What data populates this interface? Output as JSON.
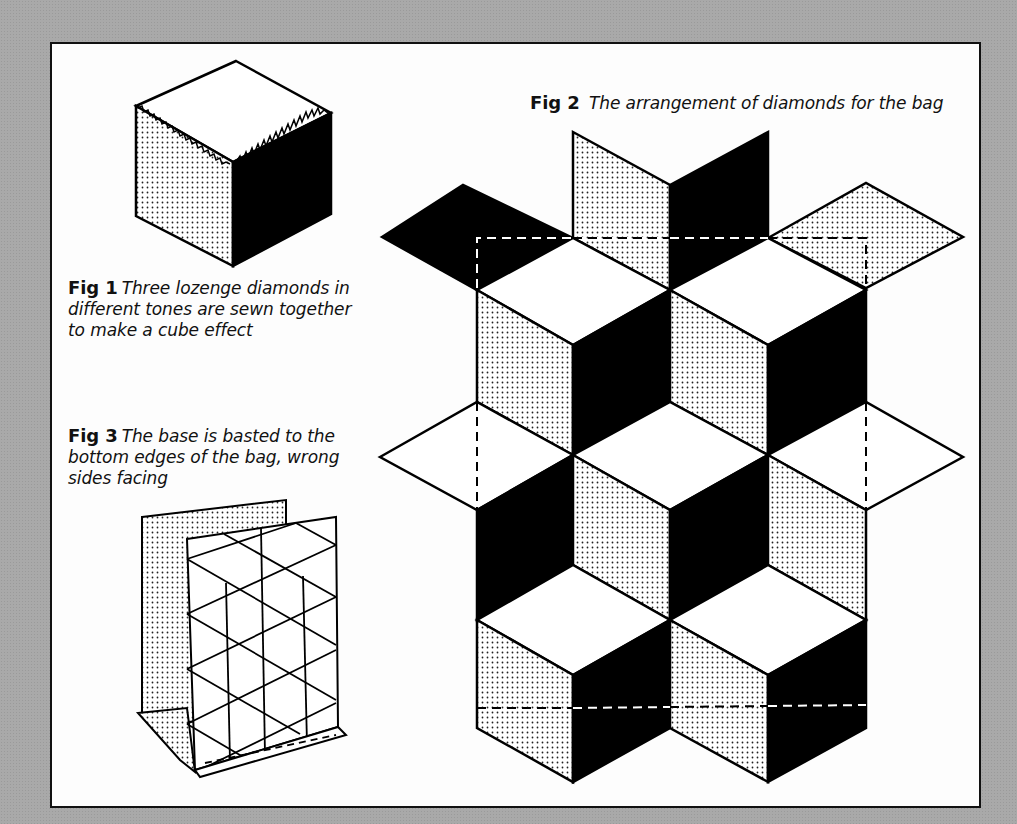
{
  "figures": [
    {
      "id": "fig1",
      "label": "Fig 1",
      "caption_lines": [
        "Three lozenge diamonds in",
        "different tones are sewn together",
        "to make a cube effect"
      ]
    },
    {
      "id": "fig2",
      "label": "Fig 2",
      "caption": "The arrangement of diamonds for the bag"
    },
    {
      "id": "fig3",
      "label": "Fig 3",
      "caption_lines": [
        "The base is basted to the",
        "bottom edges of the bag, wrong",
        "sides facing"
      ]
    }
  ],
  "tones": {
    "light": "#ffffff",
    "stipple": "dotted",
    "dark": "#000000"
  },
  "colors": {
    "background": "#a9a9a9",
    "paper": "#fdfdfd",
    "ink": "#111111"
  }
}
